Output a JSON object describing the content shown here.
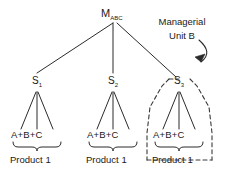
{
  "diagram": {
    "title_text": "Managerial Unit B",
    "root": {
      "label_main": "M",
      "label_sub": "ABC"
    },
    "branches": [
      {
        "id": "branch-1",
        "node_main": "S",
        "node_sub": "1",
        "leaf_label": "A+B+C",
        "caption": "Product 1",
        "highlighted": "false"
      },
      {
        "id": "branch-2",
        "node_main": "S",
        "node_sub": "2",
        "leaf_label": "A+B+C",
        "caption": "Product 1",
        "highlighted": "false"
      },
      {
        "id": "branch-3",
        "node_main": "S",
        "node_sub": "3",
        "leaf_label": "A+B+C",
        "caption": "Product 1",
        "highlighted": "true"
      }
    ],
    "annotation": {
      "line1": "Managerial",
      "line2": "Unit B"
    },
    "colors": {
      "stroke": "#2b2b2b",
      "text": "#1a1a1a",
      "background": "#ffffff",
      "dashed_stroke": "#3a3a3a"
    }
  }
}
